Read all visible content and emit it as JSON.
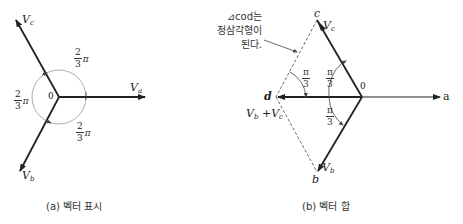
{
  "panel_a": {
    "caption": "(a) 벡터 표시",
    "origin_label": "0",
    "vectors": [
      {
        "name": "V",
        "sub": "a"
      },
      {
        "name": "V",
        "sub": "b"
      },
      {
        "name": "V",
        "sub": "c"
      }
    ],
    "angles": [
      {
        "num": "2",
        "den": "3",
        "unit": "π"
      },
      {
        "num": "2",
        "den": "3",
        "unit": "π"
      },
      {
        "num": "2",
        "den": "3",
        "unit": "π"
      }
    ]
  },
  "panel_b": {
    "caption": "(b) 벡터 합",
    "origin_label": "0",
    "axis_label": "a",
    "points": {
      "c": "c",
      "d": "d",
      "b": "b"
    },
    "vectors": [
      {
        "name": "V",
        "sub": "c"
      },
      {
        "name": "V",
        "sub": "b"
      }
    ],
    "sum_label": {
      "v1": "V",
      "s1": "b",
      "plus": " +",
      "v2": "V",
      "s2": "c"
    },
    "angles": [
      {
        "num": "π",
        "den": "3"
      },
      {
        "num": "π",
        "den": "3"
      },
      {
        "num": "π",
        "den": "3"
      }
    ],
    "note_lines": [
      "⊿cod는",
      "정삼각형이",
      "된다."
    ]
  }
}
